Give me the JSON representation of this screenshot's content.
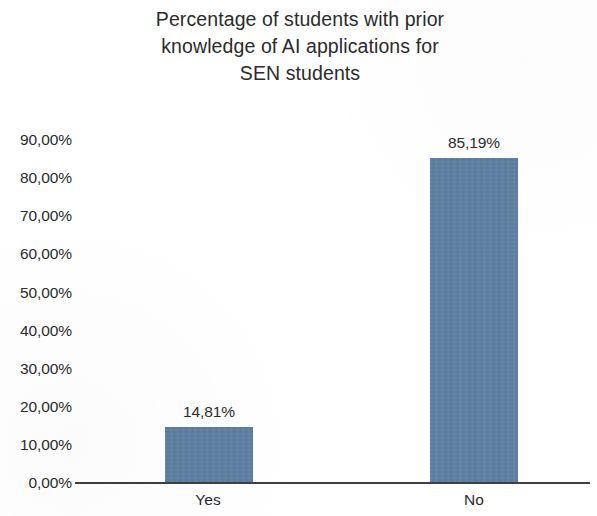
{
  "chart_data": {
    "type": "bar",
    "title": "Percentage of students with prior\nknowledge of AI applications for\nSEN students",
    "xlabel": "",
    "ylabel": "",
    "categories": [
      "Yes",
      "No"
    ],
    "values": [
      14.81,
      85.19
    ],
    "value_labels": [
      "14,81%",
      "85,19%"
    ],
    "ylim": [
      0,
      90
    ],
    "ytick_values": [
      90,
      80,
      70,
      60,
      50,
      40,
      30,
      20,
      10,
      0
    ],
    "ytick_labels": [
      "90,00%",
      "80,00%",
      "70,00%",
      "60,00%",
      "50,00%",
      "40,00%",
      "30,00%",
      "20,00%",
      "10,00%",
      "0,00%"
    ],
    "grid": false,
    "legend": false,
    "legend_position": "none",
    "series": [
      {
        "name": "Percentage of students",
        "values": [
          14.81,
          85.19
        ],
        "color": "#5d80a3"
      }
    ],
    "colors": {
      "bar": "#5d80a3",
      "axis": "#3f3f3f",
      "text": "#2b2b2b",
      "background": "#ffffff"
    }
  }
}
